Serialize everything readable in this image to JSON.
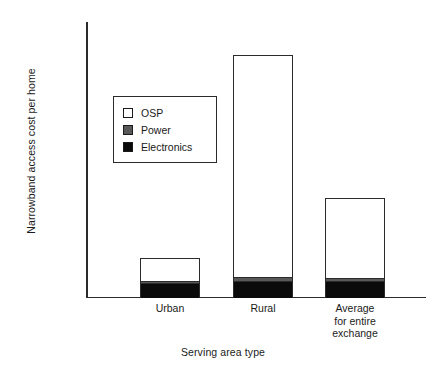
{
  "chart_data": {
    "type": "bar",
    "stacked": true,
    "title": "",
    "xlabel": "Serving area type",
    "ylabel": "Narrowband access cost per home",
    "categories": [
      "Urban",
      "Rural",
      "Average\nfor entire\nexchange"
    ],
    "category_lines": [
      [
        "Urban"
      ],
      [
        "Rural"
      ],
      [
        "Average",
        "for entire",
        "exchange"
      ]
    ],
    "ylim": [
      0,
      7000
    ],
    "ytick_values": [
      0,
      1000,
      2000,
      3000,
      4000,
      5000,
      6000,
      7000
    ],
    "ytick_labels": [
      "$0",
      "$1,000",
      "$2,000",
      "$3,000",
      "$4,000",
      "$5,000",
      "$6,000",
      "$7,000"
    ],
    "grid": false,
    "legend_position": "upper-left-inside",
    "series": [
      {
        "name": "Electronics",
        "color": "#0a0a0a",
        "values": [
          380,
          430,
          430
        ]
      },
      {
        "name": "Power",
        "color": "#585858",
        "values": [
          60,
          110,
          70
        ]
      },
      {
        "name": "OSP",
        "color": "#ffffff",
        "values": [
          570,
          5640,
          2050
        ]
      }
    ],
    "totals": [
      1010,
      6180,
      2550
    ],
    "series_order_bottom_to_top": [
      "Electronics",
      "Power",
      "OSP"
    ]
  },
  "legend": {
    "items": [
      {
        "label": "OSP",
        "swatch": "osp-swatch"
      },
      {
        "label": "Power",
        "swatch": "power-swatch"
      },
      {
        "label": "Electronics",
        "swatch": "electronics-swatch"
      }
    ]
  }
}
